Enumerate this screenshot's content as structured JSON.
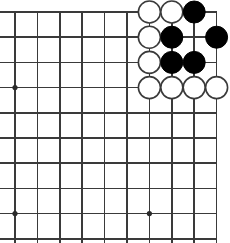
{
  "board": {
    "name": "go-board",
    "kind": "go-goban-diagram",
    "background_color": "#ffffff",
    "line_color": "#3a3a3a",
    "star_point_color": "#2b2b2b",
    "black_stone_color": "#000000",
    "white_stone_color": "#ffffff",
    "white_stone_border_color": "#3a3a3a",
    "columns": 10,
    "rows": 10,
    "origin_x": 15,
    "origin_y": 12,
    "spacing_x": 22.4,
    "spacing_y": 25.2,
    "stone_radius": 11,
    "star_points": [
      {
        "col": 0,
        "row": 3
      },
      {
        "col": 0,
        "row": 8
      },
      {
        "col": 6,
        "row": 8
      }
    ],
    "stones": [
      {
        "col": 6,
        "row": 0,
        "color": "white"
      },
      {
        "col": 7,
        "row": 0,
        "color": "white"
      },
      {
        "col": 8,
        "row": 0,
        "color": "black"
      },
      {
        "col": 6,
        "row": 1,
        "color": "white"
      },
      {
        "col": 7,
        "row": 1,
        "color": "black"
      },
      {
        "col": 9,
        "row": 1,
        "color": "black"
      },
      {
        "col": 6,
        "row": 2,
        "color": "white"
      },
      {
        "col": 7,
        "row": 2,
        "color": "black"
      },
      {
        "col": 8,
        "row": 2,
        "color": "black"
      },
      {
        "col": 6,
        "row": 3,
        "color": "white"
      },
      {
        "col": 7,
        "row": 3,
        "color": "white"
      },
      {
        "col": 8,
        "row": 3,
        "color": "white"
      },
      {
        "col": 9,
        "row": 3,
        "color": "white"
      }
    ]
  }
}
